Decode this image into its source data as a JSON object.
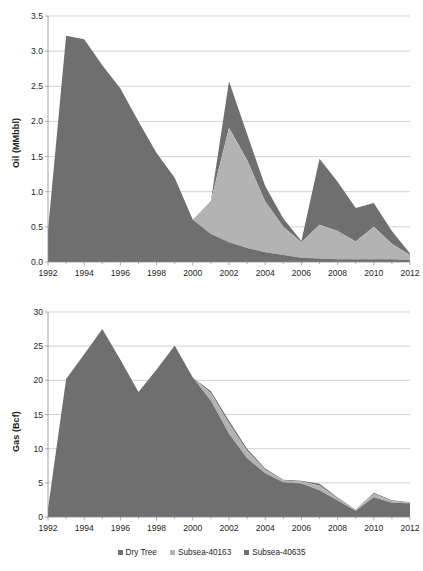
{
  "legend": {
    "items": [
      {
        "label": "Dry Tree",
        "color": "#6f6f6f",
        "icon": "square-swatch"
      },
      {
        "label": "Subsea-40163",
        "color": "#b3b3b3",
        "icon": "square-swatch"
      },
      {
        "label": "Subsea-40635",
        "color": "#6f6f6f",
        "icon": "square-swatch"
      }
    ],
    "position": "bottom-center"
  },
  "colors": {
    "dry_tree": "#6f6f6f",
    "subsea_40163": "#b3b3b3",
    "subsea_40635": "#6f6f6f",
    "grid": "#bfbfbf",
    "axis": "#8c8c8c",
    "text": "#231f20",
    "background": "#ffffff"
  },
  "chart_data": [
    {
      "id": "oil-chart",
      "type": "area",
      "stacked": true,
      "title": "",
      "xlabel": "",
      "ylabel": "Oil (MMbbl)",
      "xlim": [
        1992,
        2012
      ],
      "ylim": [
        0.0,
        3.5
      ],
      "ytick_step": 0.5,
      "xtick_step": 2,
      "minor_xticks": 1,
      "grid": "horizontal",
      "ytick_labels": [
        "0.0",
        "0.5",
        "1.0",
        "1.5",
        "2.0",
        "2.5",
        "3.0",
        "3.5"
      ],
      "xtick_labels": [
        "1992",
        "1994",
        "1996",
        "1998",
        "2000",
        "2002",
        "2004",
        "2006",
        "2008",
        "2010",
        "2012"
      ],
      "x": [
        1992,
        1993,
        1994,
        1995,
        1996,
        1997,
        1998,
        1999,
        2000,
        2001,
        2002,
        2003,
        2004,
        2005,
        2006,
        2007,
        2008,
        2009,
        2010,
        2011,
        2012
      ],
      "series": [
        {
          "name": "Dry Tree",
          "color": "#6f6f6f",
          "values": [
            0.45,
            3.22,
            3.17,
            2.8,
            2.47,
            2.0,
            1.55,
            1.2,
            0.6,
            0.4,
            0.28,
            0.2,
            0.14,
            0.1,
            0.06,
            0.05,
            0.04,
            0.04,
            0.04,
            0.04,
            0.03
          ]
        },
        {
          "name": "Subsea-40163",
          "color": "#b3b3b3",
          "values": [
            0.0,
            0.0,
            0.0,
            0.0,
            0.0,
            0.0,
            0.0,
            0.0,
            0.0,
            0.47,
            1.63,
            1.25,
            0.72,
            0.4,
            0.22,
            0.48,
            0.4,
            0.25,
            0.46,
            0.22,
            0.07
          ]
        },
        {
          "name": "Subsea-40635",
          "color": "#6f6f6f",
          "values": [
            0.0,
            0.0,
            0.0,
            0.0,
            0.0,
            0.0,
            0.0,
            0.0,
            0.0,
            0.0,
            0.66,
            0.37,
            0.22,
            0.12,
            0.02,
            0.94,
            0.7,
            0.48,
            0.34,
            0.18,
            0.02
          ]
        }
      ],
      "totals": [
        0.45,
        3.22,
        3.17,
        2.8,
        2.47,
        2.0,
        1.55,
        1.2,
        0.6,
        0.87,
        2.57,
        1.82,
        1.08,
        0.62,
        0.3,
        1.47,
        1.14,
        0.77,
        0.84,
        0.44,
        0.12
      ]
    },
    {
      "id": "gas-chart",
      "type": "area",
      "stacked": true,
      "title": "",
      "xlabel": "",
      "ylabel": "Gas (Bcf)",
      "xlim": [
        1992,
        2012
      ],
      "ylim": [
        0,
        30
      ],
      "ytick_step": 5,
      "xtick_step": 2,
      "minor_xticks": 1,
      "grid": "horizontal",
      "ytick_labels": [
        "0",
        "5",
        "10",
        "15",
        "20",
        "25",
        "30"
      ],
      "xtick_labels": [
        "1992",
        "1994",
        "1996",
        "1998",
        "2000",
        "2002",
        "2004",
        "2006",
        "2008",
        "2010",
        "2012"
      ],
      "x": [
        1992,
        1993,
        1994,
        1995,
        1996,
        1997,
        1998,
        1999,
        2000,
        2001,
        2002,
        2003,
        2004,
        2005,
        2006,
        2007,
        2008,
        2009,
        2010,
        2011,
        2012
      ],
      "series": [
        {
          "name": "Dry Tree",
          "color": "#6f6f6f",
          "values": [
            1.2,
            20.2,
            23.8,
            27.5,
            23.0,
            18.3,
            21.6,
            25.1,
            20.4,
            17.0,
            12.2,
            8.6,
            6.4,
            5.1,
            4.9,
            3.9,
            2.4,
            0.9,
            2.9,
            2.1,
            2.0
          ]
        },
        {
          "name": "Subsea-40163",
          "color": "#b3b3b3",
          "values": [
            0.0,
            0.0,
            0.0,
            0.0,
            0.0,
            0.0,
            0.0,
            0.0,
            0.0,
            1.1,
            1.5,
            1.1,
            0.5,
            0.25,
            0.3,
            0.7,
            0.3,
            0.1,
            0.5,
            0.25,
            0.1
          ]
        },
        {
          "name": "Subsea-40635",
          "color": "#6f6f6f",
          "values": [
            0.0,
            0.0,
            0.0,
            0.0,
            0.0,
            0.0,
            0.0,
            0.0,
            0.0,
            0.3,
            0.4,
            0.3,
            0.2,
            0.1,
            0.1,
            0.25,
            0.15,
            0.05,
            0.15,
            0.1,
            0.05
          ]
        }
      ],
      "totals": [
        1.2,
        20.2,
        23.8,
        27.5,
        23.0,
        18.3,
        21.6,
        25.1,
        20.4,
        18.4,
        14.1,
        10.0,
        7.1,
        5.45,
        5.3,
        4.85,
        2.85,
        1.05,
        3.55,
        2.45,
        2.15
      ]
    }
  ]
}
